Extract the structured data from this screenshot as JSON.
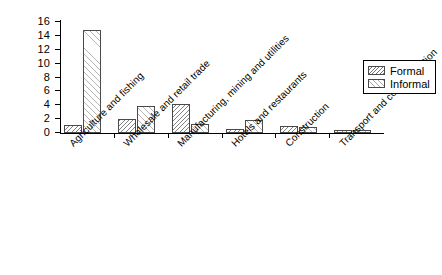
{
  "chart_data": {
    "type": "bar",
    "title": "",
    "subtitle": "",
    "xlabel": "",
    "ylabel": "",
    "ylim": [
      0,
      16
    ],
    "ytick_step": 2,
    "yticks": [
      0,
      2,
      4,
      6,
      8,
      10,
      12,
      14,
      16
    ],
    "ytick_labels": [
      "0",
      "2",
      "4",
      "6",
      "8",
      "10",
      "12",
      "14",
      "16"
    ],
    "grid": false,
    "legend_position": "top-right",
    "bar_group_mode": "grouped",
    "categories": [
      "Agriculture and fishing",
      "Wholesale and retail trade",
      "Manufacturing, mining and utilities",
      "Hotels and restaurants",
      "Construction",
      "Transport and communication"
    ],
    "series": [
      {
        "name": "Formal",
        "pattern": "dense-backslash-hatch",
        "values": [
          1.1,
          2.0,
          4.2,
          0.6,
          1.0,
          0.4
        ]
      },
      {
        "name": "Informal",
        "pattern": "sparse-forwardslash-hatch",
        "values": [
          14.8,
          3.9,
          1.3,
          1.9,
          0.9,
          0.5
        ]
      }
    ],
    "colors": {
      "bar_outline": "#4a4a4a",
      "bar_fill": "#ffffff",
      "formal_hatch": "#808080",
      "informal_hatch": "#b4b4b4",
      "axis": "#000000",
      "background": "#ffffff"
    }
  },
  "legend": {
    "items": [
      {
        "label": "Formal"
      },
      {
        "label": "Informal"
      }
    ]
  }
}
